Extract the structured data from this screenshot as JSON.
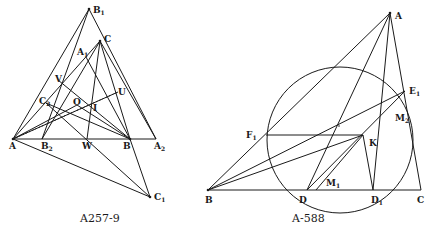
{
  "figures": [
    {
      "id": "left",
      "caption": "A257-9",
      "points": {
        "B1": {
          "label": "B",
          "sub": "1",
          "x": 89,
          "y": 9
        },
        "C": {
          "label": "C",
          "sub": "",
          "x": 100,
          "y": 41
        },
        "A1": {
          "label": "A",
          "sub": "1",
          "x": 86,
          "y": 57
        },
        "V": {
          "label": "V",
          "sub": "",
          "x": 58,
          "y": 80
        },
        "U": {
          "label": "U",
          "sub": "",
          "x": 118,
          "y": 92
        },
        "C2": {
          "label": "C",
          "sub": "2",
          "x": 46,
          "y": 103
        },
        "O": {
          "label": "O",
          "sub": "",
          "x": 77,
          "y": 105
        },
        "I": {
          "label": "I",
          "sub": "",
          "x": 90,
          "y": 106
        },
        "A": {
          "label": "A",
          "sub": "",
          "x": 13,
          "y": 139
        },
        "B2": {
          "label": "B",
          "sub": "2",
          "x": 42,
          "y": 139
        },
        "W": {
          "label": "W",
          "sub": "",
          "x": 87,
          "y": 139
        },
        "B": {
          "label": "B",
          "sub": "",
          "x": 130,
          "y": 139
        },
        "A2": {
          "label": "A",
          "sub": "2",
          "x": 156,
          "y": 139
        },
        "C1": {
          "label": "C",
          "sub": "1",
          "x": 150,
          "y": 197
        }
      }
    },
    {
      "id": "right",
      "caption": "A-588",
      "points": {
        "A": {
          "label": "A",
          "sub": "",
          "x": 390,
          "y": 13
        },
        "E1": {
          "label": "E",
          "sub": "1",
          "x": 405,
          "y": 91
        },
        "M2": {
          "label": "M",
          "sub": "2",
          "x": 407,
          "y": 113
        },
        "F1": {
          "label": "F",
          "sub": "1",
          "x": 266,
          "y": 135
        },
        "K": {
          "label": "K",
          "sub": "",
          "x": 363,
          "y": 135
        },
        "B": {
          "label": "B",
          "sub": "",
          "x": 208,
          "y": 190
        },
        "D": {
          "label": "D",
          "sub": "",
          "x": 307,
          "y": 190
        },
        "M1": {
          "label": "M",
          "sub": "1",
          "x": 316,
          "y": 190
        },
        "D1": {
          "label": "D",
          "sub": "1",
          "x": 373,
          "y": 190
        },
        "C": {
          "label": "C",
          "sub": "",
          "x": 421,
          "y": 190
        }
      },
      "circle": {
        "cx": 340,
        "cy": 140,
        "r": 73
      }
    }
  ]
}
